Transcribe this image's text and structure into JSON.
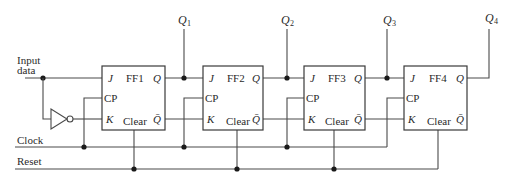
{
  "diagram": {
    "type": "4-bit shift register (JK flip-flops)",
    "inputs": {
      "input_data_line1": "Input",
      "input_data_line2": "data",
      "clock": "Clock",
      "reset": "Reset"
    },
    "outputs": [
      {
        "symbol": "Q",
        "sub": "1"
      },
      {
        "symbol": "Q",
        "sub": "2"
      },
      {
        "symbol": "Q",
        "sub": "3"
      },
      {
        "symbol": "Q",
        "sub": "4"
      }
    ],
    "flipflops": [
      {
        "name": "FF1",
        "j": "J",
        "cp": "CP",
        "k": "K",
        "clear": "Clear",
        "q": "Q",
        "qbar": "Q̄"
      },
      {
        "name": "FF2",
        "j": "J",
        "cp": "CP",
        "k": "K",
        "clear": "Clear",
        "q": "Q",
        "qbar": "Q̄"
      },
      {
        "name": "FF3",
        "j": "J",
        "cp": "CP",
        "k": "K",
        "clear": "Clear",
        "q": "Q",
        "qbar": "Q̄"
      },
      {
        "name": "FF4",
        "j": "J",
        "cp": "CP",
        "k": "K",
        "clear": "Clear",
        "q": "Q",
        "qbar": "Q̄"
      }
    ],
    "gates": [
      {
        "type": "NOT",
        "input": "Input data",
        "output": "FF1.K"
      }
    ],
    "colors": {
      "line": "#4a4a4a",
      "background": "#ffffff"
    }
  }
}
